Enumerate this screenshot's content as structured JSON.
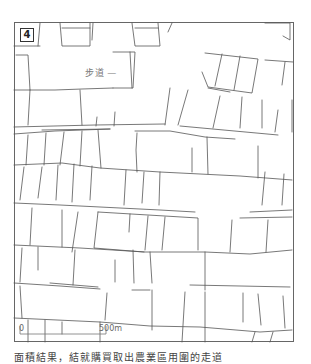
{
  "figure": {
    "panel_number": "4",
    "labels": {
      "walkway": "步道"
    },
    "scale_bar": {
      "start": "0",
      "end": "500m"
    },
    "caption": "面積結果，結就購買取出農業區用圍的走道"
  },
  "colors": {
    "line": "#555555",
    "frame": "#666666",
    "background": "#ffffff"
  }
}
